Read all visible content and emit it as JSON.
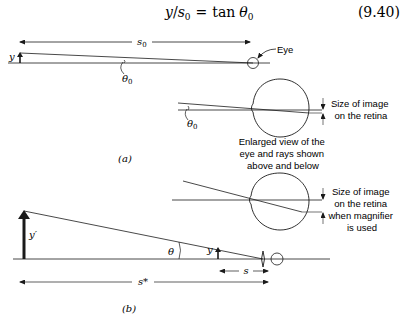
{
  "equation": {
    "lhs_var": "y",
    "slash": "/",
    "denom_var": "s",
    "denom_sub": "0",
    "equals": "=",
    "func": "tan",
    "angle": "θ",
    "angle_sub": "0",
    "number": "(9.40)"
  },
  "figure_a": {
    "panel_label": "(a)",
    "distance_label": "s",
    "distance_sub": "0",
    "object_label": "y",
    "angle_label": "θ",
    "angle_sub": "0",
    "eye_label": "Eye",
    "enlarged_angle_label": "θ",
    "enlarged_angle_sub": "0",
    "retina_caption": [
      "Size of image",
      "on the retina"
    ],
    "enlarged_caption": [
      "Enlarged view of the",
      "eye and rays shown",
      "above and below"
    ]
  },
  "figure_b": {
    "panel_label": "(b)",
    "retina_caption": [
      "Size of image",
      "on the retina",
      "when magnifier",
      "is used"
    ],
    "image_label": "y′",
    "object_label": "y",
    "angle_label": "θ",
    "near_distance_label": "s",
    "image_distance_label": "s*"
  },
  "colors": {
    "ink": "#1a1a1a",
    "background": "#ffffff"
  }
}
